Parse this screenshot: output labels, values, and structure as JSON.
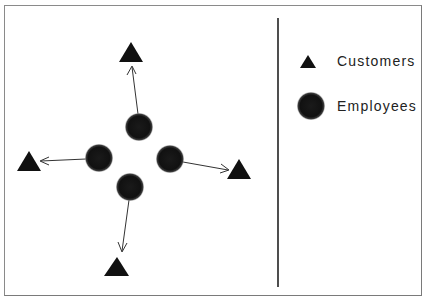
{
  "diagram": {
    "type": "relationship-diagram",
    "colors": {
      "shape_fill": "#111111",
      "arrow": "#333333",
      "border": "#8a8a8a",
      "divider": "#222222",
      "text": "#222222",
      "background": "#ffffff"
    },
    "employees": [
      {
        "id": "e-top",
        "cx": 139,
        "cy": 127
      },
      {
        "id": "e-left",
        "cx": 99,
        "cy": 158
      },
      {
        "id": "e-right",
        "cx": 170,
        "cy": 159
      },
      {
        "id": "e-bottom",
        "cx": 130,
        "cy": 187
      }
    ],
    "customers": [
      {
        "id": "c-top",
        "x": 131,
        "y": 52
      },
      {
        "id": "c-left",
        "x": 29,
        "y": 161
      },
      {
        "id": "c-right",
        "x": 239,
        "y": 169
      },
      {
        "id": "c-bottom",
        "x": 117,
        "y": 267
      }
    ],
    "edges": [
      {
        "from": "e-top",
        "to": "c-top"
      },
      {
        "from": "e-left",
        "to": "c-left"
      },
      {
        "from": "e-right",
        "to": "c-right"
      },
      {
        "from": "e-bottom",
        "to": "c-bottom"
      }
    ]
  },
  "legend": {
    "items": [
      {
        "symbol": "triangle",
        "label": "Customers"
      },
      {
        "symbol": "circle",
        "label": "Employees"
      }
    ]
  }
}
